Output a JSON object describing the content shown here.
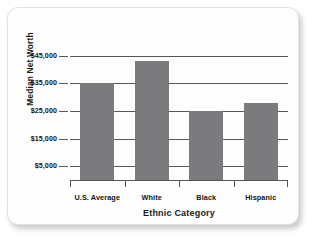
{
  "chart_data": {
    "type": "bar",
    "title": "",
    "categories": [
      "U.S. Average",
      "White",
      "Black",
      "Hispanic"
    ],
    "values": [
      35000,
      43000,
      25000,
      28000
    ],
    "xlabel": "Ethnic Category",
    "ylabel": "Median Net Worth",
    "ylim": [
      0,
      50000
    ],
    "ytick_values": [
      5000,
      15000,
      25000,
      35000,
      45000
    ],
    "ytick_labels": [
      "$5,000",
      "$15,000",
      "$25,000",
      "$35,000",
      "$45,000"
    ],
    "grid": true,
    "legend": false,
    "bar_color": "#7b7b7d",
    "axis_color": "#58585a",
    "background": "#fdfdfd"
  }
}
